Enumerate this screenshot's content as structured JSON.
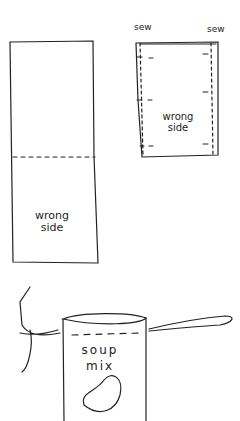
{
  "colors": {
    "ink": "#222222",
    "background": "#ffffff",
    "faint_text": "#bbbbbb"
  },
  "caption_top": "",
  "panels": {
    "folded_fabric": {
      "label_line1": "wrong",
      "label_line2": "side",
      "fold_line": "dashed"
    },
    "sewn_pouch": {
      "sew_left": "sew",
      "sew_right": "sew",
      "label_line1": "wrong",
      "label_line2": "side",
      "seam_lines": "dashed"
    },
    "soup_bag": {
      "label_line1": "soup",
      "label_line2": "mix",
      "drawstring": "tie"
    }
  }
}
